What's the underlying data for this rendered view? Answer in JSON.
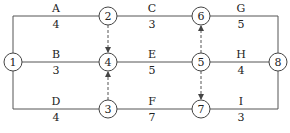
{
  "diagram": {
    "type": "activity-network",
    "colors": {
      "line": "#444444",
      "node_fill": "#ffffff",
      "text": "#222222"
    },
    "nodes": [
      {
        "id": "1",
        "label": "1",
        "x": 13,
        "y": 62
      },
      {
        "id": "2",
        "label": "2",
        "x": 108,
        "y": 16
      },
      {
        "id": "3",
        "label": "3",
        "x": 108,
        "y": 109
      },
      {
        "id": "4",
        "label": "4",
        "x": 108,
        "y": 62
      },
      {
        "id": "5",
        "label": "5",
        "x": 201,
        "y": 62
      },
      {
        "id": "6",
        "label": "6",
        "x": 201,
        "y": 16
      },
      {
        "id": "7",
        "label": "7",
        "x": 201,
        "y": 109
      },
      {
        "id": "8",
        "label": "8",
        "x": 278,
        "y": 62
      }
    ],
    "activities": [
      {
        "name": "A",
        "duration": "4",
        "from": "1",
        "to": "2"
      },
      {
        "name": "B",
        "duration": "3",
        "from": "1",
        "to": "4"
      },
      {
        "name": "D",
        "duration": "4",
        "from": "1",
        "to": "3"
      },
      {
        "name": "C",
        "duration": "3",
        "from": "2",
        "to": "6"
      },
      {
        "name": "E",
        "duration": "5",
        "from": "4",
        "to": "5"
      },
      {
        "name": "F",
        "duration": "7",
        "from": "3",
        "to": "7"
      },
      {
        "name": "G",
        "duration": "5",
        "from": "6",
        "to": "8"
      },
      {
        "name": "H",
        "duration": "4",
        "from": "5",
        "to": "8"
      },
      {
        "name": "I",
        "duration": "3",
        "from": "7",
        "to": "8"
      }
    ],
    "dummy_activities": [
      {
        "from": "2",
        "to": "4"
      },
      {
        "from": "3",
        "to": "4"
      },
      {
        "from": "5",
        "to": "6"
      },
      {
        "from": "5",
        "to": "7"
      }
    ]
  }
}
